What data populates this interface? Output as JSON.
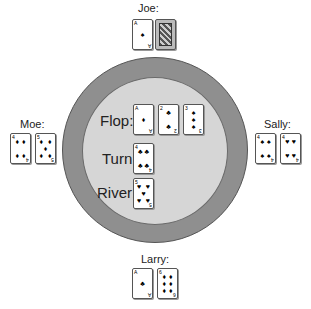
{
  "table": {
    "outer_color": "#8f8f8f",
    "inner_color": "#d6d6d6"
  },
  "players": [
    {
      "name": "Joe:",
      "cards": [
        {
          "rank": "A",
          "suit": "spades"
        },
        {
          "rank": "Q",
          "suit": "face"
        }
      ]
    },
    {
      "name": "Moe:",
      "cards": [
        {
          "rank": "4",
          "suit": "diamonds"
        },
        {
          "rank": "5",
          "suit": "diamonds"
        }
      ]
    },
    {
      "name": "Sally:",
      "cards": [
        {
          "rank": "4",
          "suit": "spades"
        },
        {
          "rank": "4",
          "suit": "hearts"
        }
      ]
    },
    {
      "name": "Larry:",
      "cards": [
        {
          "rank": "A",
          "suit": "clubs"
        },
        {
          "rank": "6",
          "suit": "diamonds"
        }
      ]
    }
  ],
  "board": {
    "flop_label": "Flop:",
    "turn_label": "Turn:",
    "river_label": "River:",
    "flop": [
      {
        "rank": "A",
        "suit": "diamonds"
      },
      {
        "rank": "2",
        "suit": "clubs"
      },
      {
        "rank": "3",
        "suit": "spades"
      }
    ],
    "turn": {
      "rank": "4",
      "suit": "clubs"
    },
    "river": {
      "rank": "5",
      "suit": "hearts"
    }
  }
}
